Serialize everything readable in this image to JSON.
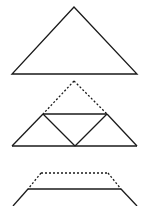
{
  "figure": {
    "stroke_color": "#1a1a1a",
    "background": "#ffffff",
    "stages": [
      {
        "name": "full-triangle",
        "solid_lines": 3,
        "dashed_lines": 0
      },
      {
        "name": "folded-apex-triangle",
        "solid_lines": 5,
        "dashed_lines": 2
      },
      {
        "name": "truncated-trapezoid",
        "solid_lines": 3,
        "dashed_lines": 3
      }
    ]
  }
}
